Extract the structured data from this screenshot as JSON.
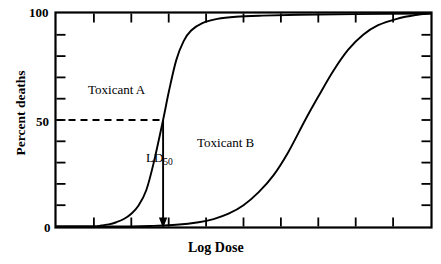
{
  "chart_data": {
    "type": "line",
    "title": "",
    "xlabel": "Log Dose",
    "ylabel": "Percent deaths",
    "xlim": [
      0,
      10
    ],
    "ylim": [
      0,
      100
    ],
    "grid": false,
    "legend_position": "inline-annotation",
    "x_tick_labels": [],
    "y_tick_labels": [
      "0",
      "50",
      "100"
    ],
    "y_ticks": [
      0,
      10,
      20,
      30,
      40,
      50,
      60,
      70,
      80,
      90,
      100
    ],
    "x_ticks": [
      0,
      1,
      2,
      3,
      4,
      5,
      6,
      7,
      8,
      9,
      10
    ],
    "series": [
      {
        "name": "Toxicant A",
        "label": "Toxicant A",
        "ld50_x": 2.85,
        "x": [
          0.0,
          0.5,
          1.0,
          1.2,
          1.4,
          1.6,
          1.8,
          2.0,
          2.2,
          2.4,
          2.6,
          2.85,
          3.0,
          3.2,
          3.4,
          3.6,
          3.9,
          4.3,
          4.8,
          5.5,
          6.5,
          8.0,
          10.0
        ],
        "values": [
          0,
          0,
          0,
          0.5,
          1,
          2,
          3.5,
          6,
          10,
          17,
          30,
          50,
          63,
          78,
          87,
          92,
          95.5,
          97.5,
          98.5,
          99,
          99.4,
          99.7,
          100
        ]
      },
      {
        "name": "Toxicant B",
        "label": "Toxicant B",
        "ld50_x": 6.65,
        "x": [
          0.0,
          1.0,
          2.0,
          2.6,
          3.2,
          3.8,
          4.2,
          4.6,
          5.0,
          5.4,
          5.8,
          6.2,
          6.65,
          7.0,
          7.4,
          7.8,
          8.2,
          8.6,
          9.1,
          9.6,
          10.0
        ],
        "values": [
          0,
          0,
          0,
          0.3,
          0.8,
          2,
          3.5,
          6,
          10,
          16,
          24,
          35,
          50,
          61,
          73,
          83,
          90,
          94.5,
          97.5,
          99.3,
          100
        ]
      }
    ],
    "annotations": [
      {
        "name": "ld50-marker",
        "label": "LD",
        "sub": "50",
        "x": 2.85,
        "y_from": 50,
        "y_to": 0,
        "style": "arrow-down"
      },
      {
        "name": "ld50-guide",
        "y": 50,
        "x_from": 0,
        "x_to": 2.85,
        "style": "dashed"
      }
    ],
    "colors": {
      "line": "#000000",
      "background": "#ffffff",
      "axis": "#000000"
    }
  },
  "axes": {
    "y_label": "Percent deaths",
    "x_label": "Log Dose",
    "y_tick_top": "100",
    "y_tick_mid": "50",
    "y_tick_bottom": "0"
  },
  "labels": {
    "toxicant_a": "Toxicant A",
    "toxicant_b": "Toxicant B",
    "ld50_base": "LD",
    "ld50_sub": "50"
  }
}
